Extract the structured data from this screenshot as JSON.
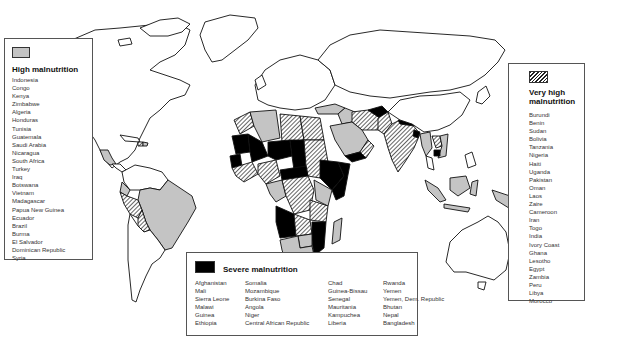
{
  "map": {
    "title": "World malnutrition map",
    "colors": {
      "high": "#c4c4c4",
      "very_high": "hatched",
      "severe": "#000000",
      "none": "#ffffff"
    }
  },
  "legends": {
    "high": {
      "title": "High malnutrition",
      "swatch": "light-gray",
      "countries": [
        "Indonesia",
        "Congo",
        "Kenya",
        "Zimbabwe",
        "Algeria",
        "Honduras",
        "Tunisia",
        "Guatemala",
        "Saudi Arabia",
        "Nicaragua",
        "South Africa",
        "Turkey",
        "Iraq",
        "Botswana",
        "Vietnam",
        "Madagascar",
        "Papua New Guinea",
        "Ecuador",
        "Brazil",
        "Burma",
        "El Salvador",
        "Dominican Republic",
        "Syria"
      ]
    },
    "very_high": {
      "title_line1": "Very high",
      "title_line2": "malnutrition",
      "swatch": "diagonal-hatch",
      "countries": [
        "Burundi",
        "Benin",
        "Sudan",
        "Bolivia",
        "Tanzania",
        "Nigeria",
        "Haiti",
        "Uganda",
        "Pakistan",
        "Oman",
        "Laos",
        "Zaire",
        "Cameroon",
        "Iran",
        "Togo",
        "India",
        "Ivory Coast",
        "Ghana",
        "Lesotho",
        "Egypt",
        "Zambia",
        "Peru",
        "Libya",
        "Morocco"
      ]
    },
    "severe": {
      "title": "Severe malnutrition",
      "swatch": "black",
      "columns": [
        [
          "Afghanistan",
          "Mali",
          "Sierra Leone",
          "Malawi",
          "Guinea",
          "Ethiopia"
        ],
        [
          "Somalia",
          "Mozambique",
          "Burkina Faso",
          "Angola",
          "Niger",
          "Central African Republic"
        ],
        [
          "Chad",
          "Guinea-Bissau",
          "Senegal",
          "Mauritania",
          "Kampuchea",
          "Liberia"
        ],
        [
          "Rwanda",
          "Yemen",
          "Yemen, Dem. Republic",
          "Bhutan",
          "Nepal",
          "Bangladesh"
        ]
      ]
    }
  }
}
